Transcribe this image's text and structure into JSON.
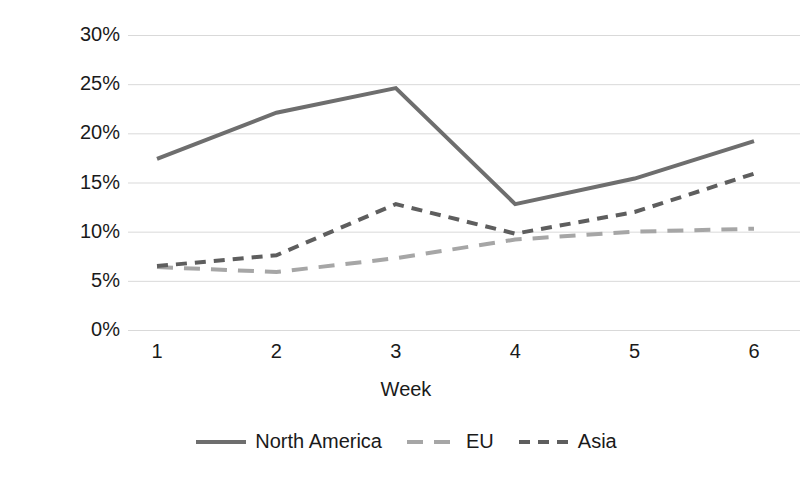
{
  "chart_data": {
    "type": "line",
    "title": "",
    "xlabel": "Week",
    "ylabel": "Inventory % of budget",
    "categories": [
      "1",
      "2",
      "3",
      "4",
      "5",
      "6"
    ],
    "x": [
      1,
      2,
      3,
      4,
      5,
      6
    ],
    "ylim": [
      0,
      30
    ],
    "yticks": [
      0,
      5,
      10,
      15,
      20,
      25,
      30
    ],
    "ytick_labels": [
      "0%",
      "5%",
      "10%",
      "15%",
      "20%",
      "25%",
      "30%"
    ],
    "grid": "horizontal",
    "legend_position": "bottom",
    "series": [
      {
        "name": "North America",
        "values": [
          17.4,
          22.1,
          24.6,
          12.8,
          15.4,
          19.2
        ],
        "style": "solid",
        "color": "#6e6e6e"
      },
      {
        "name": "EU",
        "values": [
          6.4,
          5.9,
          7.3,
          9.2,
          10.0,
          10.3
        ],
        "style": "long-dash",
        "color": "#a6a6a6"
      },
      {
        "name": "Asia",
        "values": [
          6.5,
          7.6,
          12.8,
          9.8,
          12.0,
          15.9
        ],
        "style": "short-dash",
        "color": "#5e5e5e"
      }
    ]
  },
  "axes": {
    "y_label": "Inventory % of budget",
    "x_label": "Week",
    "y_tick_labels": [
      "30%",
      "25%",
      "20%",
      "15%",
      "10%",
      "5%",
      "0%"
    ],
    "x_tick_labels": [
      "1",
      "2",
      "3",
      "4",
      "5",
      "6"
    ]
  },
  "legend": {
    "items": [
      {
        "label": "North America"
      },
      {
        "label": "EU"
      },
      {
        "label": "Asia"
      }
    ]
  },
  "colors": {
    "north_america": "#6e6e6e",
    "eu": "#a6a6a6",
    "asia": "#5e5e5e",
    "gridline": "#d9d9d9",
    "text": "#1a1a1a",
    "background": "#ffffff"
  }
}
